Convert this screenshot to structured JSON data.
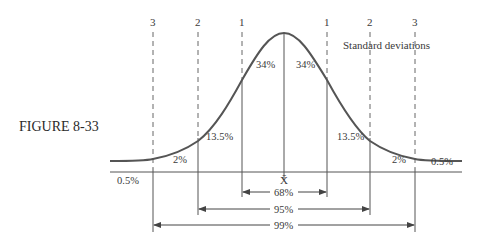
{
  "figure_label": "FIGURE 8-33",
  "legend": "Standard deviations",
  "sd_markers": {
    "neg3": "3",
    "neg2": "2",
    "neg1": "1",
    "pos1": "1",
    "pos2": "2",
    "pos3": "3"
  },
  "regions": {
    "left_tail": "0.5%",
    "left_2": "2%",
    "left_13": "13.5%",
    "left_34": "34%",
    "right_34": "34%",
    "right_13": "13.5%",
    "right_2": "2%",
    "right_tail": "0.5%"
  },
  "mean_label": "X̄",
  "intervals": {
    "one_sd": "68%",
    "two_sd": "95%",
    "three_sd": "99%"
  },
  "colors": {
    "curve": "#555555",
    "lines": "#555555",
    "text": "#3a3a3a"
  }
}
